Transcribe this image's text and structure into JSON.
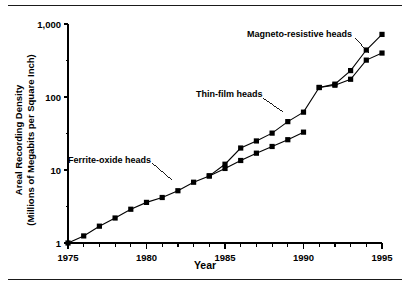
{
  "chart_data": {
    "type": "line",
    "title": "",
    "xlabel": "Year",
    "ylabel": "Areal Recording Density (Millions of Megabits per Square Inch)",
    "ylabel_line1": "Areal Recording Density",
    "ylabel_line2": "(Millions of Megabits per Square Inch)",
    "xlim": [
      1975,
      1995
    ],
    "ylim": [
      1,
      1000
    ],
    "yscale": "log",
    "grid": false,
    "legend_position": "inline-annotations",
    "xticks": [
      1975,
      1976,
      1977,
      1978,
      1979,
      1980,
      1981,
      1982,
      1983,
      1984,
      1985,
      1986,
      1987,
      1988,
      1989,
      1990,
      1991,
      1992,
      1993,
      1994,
      1995
    ],
    "xtick_labels": [
      "1975",
      "1980",
      "1985",
      "1990",
      "1995"
    ],
    "xtick_label_values": [
      1975,
      1980,
      1985,
      1990,
      1995
    ],
    "ytick_values": [
      1,
      10,
      100,
      1000
    ],
    "ytick_labels": [
      "1",
      "10",
      "100",
      "1,000"
    ],
    "yminor_values": [
      3.2,
      32,
      320
    ],
    "series": [
      {
        "name": "Ferrite-oxide heads",
        "marker": "square",
        "x": [
          1975,
          1976,
          1977,
          1978,
          1979,
          1980,
          1981,
          1982,
          1983,
          1984,
          1985,
          1986,
          1987,
          1988,
          1989,
          1990
        ],
        "values": [
          1.0,
          1.25,
          1.7,
          2.2,
          2.9,
          3.6,
          4.2,
          5.2,
          6.8,
          8.3,
          10.5,
          13.5,
          17.0,
          21.0,
          26.0,
          33.0
        ]
      },
      {
        "name": "Thin-film heads",
        "marker": "square",
        "x": [
          1984,
          1985,
          1986,
          1987,
          1988,
          1989,
          1990,
          1991,
          1992,
          1993,
          1994,
          1995
        ],
        "values": [
          8.3,
          12.0,
          20.0,
          25.0,
          32.0,
          46.0,
          62.0,
          135.0,
          145.0,
          175.0,
          320.0,
          400.0
        ]
      },
      {
        "name": "Magneto-resistive heads",
        "marker": "square",
        "x": [
          1991,
          1992,
          1993,
          1994,
          1995
        ],
        "values": [
          135.0,
          150.0,
          230.0,
          440.0,
          720.0
        ]
      }
    ],
    "annotations": [
      {
        "text": "Ferrite-oxide heads",
        "x_px": 68,
        "y_px": 155
      },
      {
        "text": "Thin-film heads",
        "x_px": 196,
        "y_px": 89
      },
      {
        "text": "Magneto-resistive heads",
        "x_px": 247,
        "y_px": 29
      }
    ]
  }
}
